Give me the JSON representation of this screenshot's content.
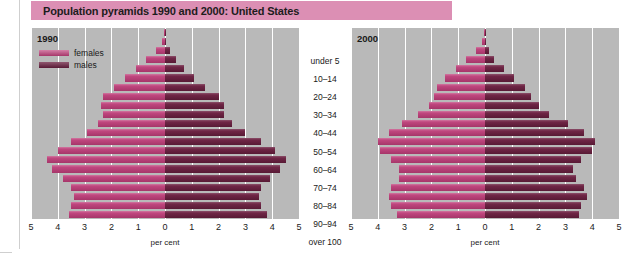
{
  "title": "Population pyramids 1990 and 2000: United States",
  "legend": {
    "females_label": "females",
    "males_label": "males",
    "female_color": "#bd3d78",
    "male_color": "#6b1f40"
  },
  "panels": [
    {
      "year_label": "1990"
    },
    {
      "year_label": "2000"
    }
  ],
  "axis": {
    "x_title": "per cent",
    "x_ticks": [
      "5",
      "4",
      "3",
      "2",
      "1",
      "0",
      "1",
      "2",
      "3",
      "4",
      "5"
    ],
    "x_tick_values": [
      -5,
      -4,
      -3,
      -2,
      -1,
      0,
      1,
      2,
      3,
      4,
      5
    ],
    "age_labels_shown": [
      "over 100",
      "90–94",
      "80–84",
      "70–74",
      "60–64",
      "50–54",
      "40–44",
      "30–34",
      "20–24",
      "10–14",
      "under 5"
    ]
  },
  "colors": {
    "banner": "#dc8fb4",
    "plot_background": "#b9b9b9",
    "gridline": "#ffffff",
    "text": "#1a1a1a"
  },
  "chart_data": {
    "type": "bar",
    "title": "Population pyramids 1990 and 2000: United States",
    "subtype": "population-pyramid",
    "xlabel": "per cent",
    "ylabel": "age group",
    "xlim": [
      -5,
      5
    ],
    "grid": true,
    "legend_position": "top-left",
    "categories": [
      "under 5",
      "5–9",
      "10–14",
      "15–19",
      "20–24",
      "25–29",
      "30–34",
      "35–39",
      "40–44",
      "45–49",
      "50–54",
      "55–59",
      "60–64",
      "65–69",
      "70–74",
      "75–79",
      "80–84",
      "85–89",
      "90–94",
      "95–99",
      "over 100"
    ],
    "panels": [
      {
        "name": "1990",
        "series": [
          {
            "name": "females",
            "side": "left",
            "color": "#bd3d78",
            "values": [
              3.6,
              3.5,
              3.4,
              3.5,
              3.8,
              4.2,
              4.4,
              4.0,
              3.5,
              2.9,
              2.5,
              2.3,
              2.4,
              2.3,
              1.9,
              1.5,
              1.1,
              0.7,
              0.35,
              0.12,
              0.03
            ]
          },
          {
            "name": "males",
            "side": "right",
            "color": "#6b1f40",
            "values": [
              3.8,
              3.6,
              3.5,
              3.6,
              3.9,
              4.3,
              4.5,
              4.1,
              3.6,
              3.0,
              2.5,
              2.2,
              2.2,
              2.0,
              1.5,
              1.1,
              0.7,
              0.4,
              0.17,
              0.05,
              0.02
            ]
          }
        ]
      },
      {
        "name": "2000",
        "series": [
          {
            "name": "females",
            "side": "left",
            "color": "#bd3d78",
            "values": [
              3.3,
              3.5,
              3.6,
              3.5,
              3.2,
              3.2,
              3.5,
              3.9,
              4.0,
              3.6,
              3.1,
              2.5,
              2.1,
              1.9,
              1.8,
              1.5,
              1.1,
              0.7,
              0.35,
              0.12,
              0.03
            ]
          },
          {
            "name": "males",
            "side": "right",
            "color": "#6b1f40",
            "values": [
              3.5,
              3.6,
              3.8,
              3.7,
              3.4,
              3.3,
              3.6,
              4.0,
              4.1,
              3.7,
              3.1,
              2.4,
              2.0,
              1.7,
              1.5,
              1.1,
              0.7,
              0.35,
              0.15,
              0.04,
              0.01
            ]
          }
        ]
      }
    ]
  }
}
